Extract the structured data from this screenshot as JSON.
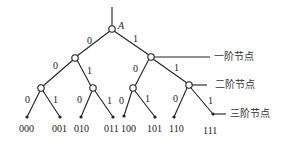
{
  "diagram": {
    "type": "binary-tree",
    "root_label": "A",
    "edge_labels": {
      "root_left": "0",
      "root_right": "1",
      "l1_left_left": "0",
      "l1_left_right": "1",
      "l1_right_left": "0",
      "l1_right_right": "1",
      "l2_0_left": "0",
      "l2_0_right": "1",
      "l2_1_left": "0",
      "l2_1_right": "1",
      "l2_2_left": "0",
      "l2_2_right": "1",
      "l2_3_left": "0",
      "l2_3_right": "1"
    },
    "leaves": [
      "000",
      "001",
      "010",
      "011",
      "100",
      "101",
      "110",
      "111"
    ],
    "order_labels": {
      "first": "一阶节点",
      "second": "二阶节点",
      "third": "三阶节点"
    },
    "colors": {
      "line": "#222222",
      "node_fill": "#ffffff"
    }
  }
}
